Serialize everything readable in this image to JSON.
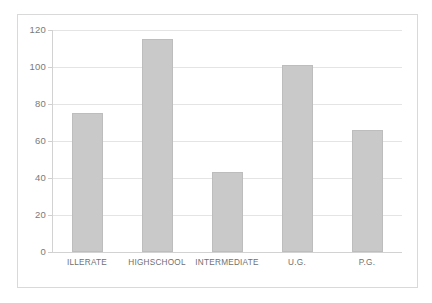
{
  "chart_data": {
    "type": "bar",
    "title": "",
    "subtitle": "",
    "xlabel": "",
    "ylabel": "",
    "categories": [
      "ILLERATE",
      "HIGHSCHOOL",
      "INTERMEDIATE",
      "U.G.",
      "P.G."
    ],
    "values": [
      75,
      115,
      43,
      101,
      66
    ],
    "ylim": [
      0,
      120
    ],
    "ytick_values": [
      0,
      20,
      40,
      60,
      80,
      100,
      120
    ],
    "ytick_labels": [
      "0",
      "20",
      "40",
      "60",
      "80",
      "100",
      "120"
    ],
    "grid": true,
    "grid_axis": "y",
    "legend": false,
    "legend_position": "none",
    "series": [
      {
        "name": "",
        "values": [
          75,
          115,
          43,
          101,
          66
        ]
      }
    ],
    "bar_color": "#c9c9c9",
    "bar_edge_color": "#bdbdbd",
    "gridline_color": "#e4e4e4",
    "axis_color": "#d2d2d2",
    "text_color": "#7a7a7a",
    "background_color": "#ffffff",
    "frame_color": "#d9d9d9"
  }
}
